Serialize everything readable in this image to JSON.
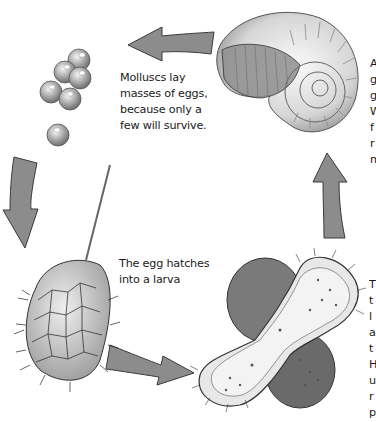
{
  "diagram": {
    "type": "life-cycle",
    "stages": [
      {
        "id": "eggs",
        "label": "Molluscs lay\nmasses of eggs,\nbecause only a\nfew will survive."
      },
      {
        "id": "larva",
        "label": "The egg hatches\ninto a larva"
      },
      {
        "id": "veliger",
        "label_fragment": "T\nt\nl\na\nt\nH\nu\nr\np"
      },
      {
        "id": "adult-shell",
        "label_fragment": "A\ng\ng\nW\nf\nr\nm"
      }
    ],
    "arrows": [
      {
        "from": "adult-shell",
        "to": "eggs",
        "direction": "left"
      },
      {
        "from": "eggs",
        "to": "larva",
        "direction": "down"
      },
      {
        "from": "larva",
        "to": "veliger",
        "direction": "right"
      },
      {
        "from": "veliger",
        "to": "adult-shell",
        "direction": "up"
      }
    ],
    "colors": {
      "arrow_fill": "#8c8c8c",
      "arrow_stroke": "#3a3a3a",
      "background": "#ffffff",
      "text": "#1a1a1a"
    }
  }
}
